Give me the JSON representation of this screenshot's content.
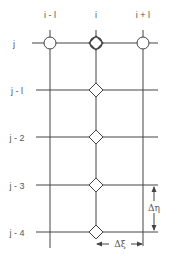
{
  "diagram": {
    "column_labels": [
      "i - l",
      "i",
      "i + l"
    ],
    "row_labels": [
      "j",
      "j - l",
      "j - 2",
      "j - 3",
      "j - 4"
    ],
    "delta_eta_label": "Δη",
    "delta_xi_label": "Δξ",
    "colors": {
      "line": "#444444",
      "text": "#555555",
      "background": "#ffffff"
    },
    "markers": {
      "circle_nodes": [
        "(i-1, j)",
        "(i, j)",
        "(i+1, j)"
      ],
      "diamond_nodes": [
        "(i, j)",
        "(i, j-1)",
        "(i, j-2)",
        "(i, j-3)",
        "(i, j-4)"
      ]
    }
  }
}
